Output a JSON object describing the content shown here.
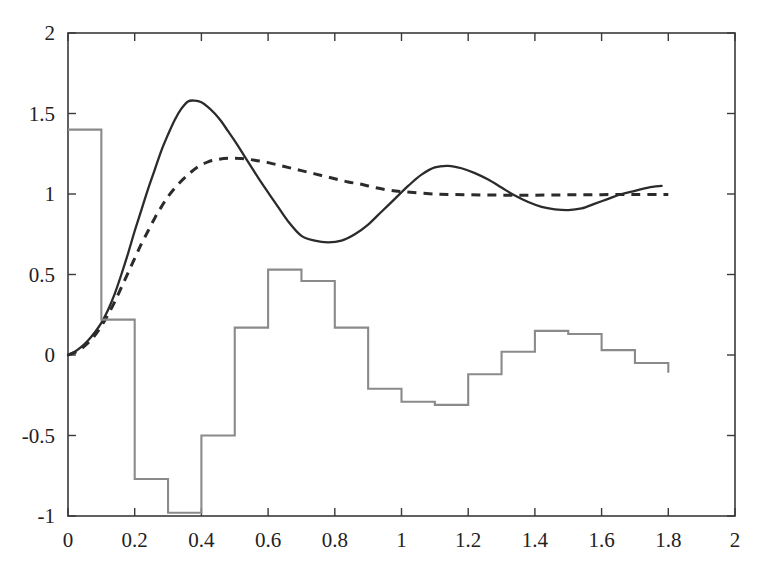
{
  "chart_data": {
    "type": "line",
    "title": "",
    "subtitle": "",
    "xlabel": "",
    "ylabel": "",
    "xlim": [
      0,
      2
    ],
    "ylim": [
      -1,
      2
    ],
    "grid": false,
    "legend": "none",
    "background_color": "#ffffff",
    "xticks": [
      0,
      0.2,
      0.4,
      0.6,
      0.8,
      1,
      1.2,
      1.4,
      1.6,
      1.8,
      2
    ],
    "xtick_labels": [
      "0",
      "0.2",
      "0.4",
      "0.6",
      "0.8",
      "1",
      "1.2",
      "1.4",
      "1.6",
      "1.8",
      "2"
    ],
    "yticks": [
      -1,
      -0.5,
      0,
      0.5,
      1,
      1.5,
      2
    ],
    "ytick_labels": [
      "-1",
      "-0.5",
      "0",
      "0.5",
      "1",
      "1.5",
      "2"
    ],
    "series": [
      {
        "name": "solid-response",
        "style": "solid",
        "color": "#2b2b2b",
        "linewidth": 2.3,
        "x": [
          0,
          0.02,
          0.04,
          0.06,
          0.08,
          0.1,
          0.12,
          0.14,
          0.16,
          0.18,
          0.2,
          0.22,
          0.24,
          0.26,
          0.28,
          0.3,
          0.32,
          0.34,
          0.36,
          0.38,
          0.4,
          0.42,
          0.44,
          0.46,
          0.48,
          0.5,
          0.54,
          0.58,
          0.62,
          0.66,
          0.7,
          0.74,
          0.78,
          0.82,
          0.86,
          0.9,
          0.94,
          0.98,
          1.02,
          1.06,
          1.1,
          1.14,
          1.18,
          1.22,
          1.26,
          1.3,
          1.34,
          1.38,
          1.42,
          1.46,
          1.5,
          1.54,
          1.58,
          1.62,
          1.66,
          1.7,
          1.74,
          1.78
        ],
        "y": [
          0.0,
          0.02,
          0.05,
          0.09,
          0.14,
          0.2,
          0.28,
          0.38,
          0.5,
          0.63,
          0.77,
          0.9,
          1.03,
          1.15,
          1.27,
          1.37,
          1.46,
          1.53,
          1.575,
          1.58,
          1.57,
          1.54,
          1.5,
          1.45,
          1.39,
          1.33,
          1.2,
          1.07,
          0.95,
          0.83,
          0.74,
          0.71,
          0.7,
          0.71,
          0.75,
          0.81,
          0.89,
          0.97,
          1.05,
          1.12,
          1.165,
          1.175,
          1.16,
          1.13,
          1.09,
          1.04,
          0.99,
          0.95,
          0.92,
          0.905,
          0.9,
          0.91,
          0.94,
          0.97,
          1.0,
          1.02,
          1.04,
          1.05
        ]
      },
      {
        "name": "dashed-response",
        "style": "dashed",
        "color": "#2b2b2b",
        "linewidth": 3.0,
        "dasharray": "9 7",
        "x": [
          0,
          0.02,
          0.04,
          0.06,
          0.08,
          0.1,
          0.12,
          0.14,
          0.16,
          0.18,
          0.2,
          0.22,
          0.24,
          0.26,
          0.28,
          0.3,
          0.33,
          0.36,
          0.39,
          0.42,
          0.45,
          0.48,
          0.52,
          0.56,
          0.6,
          0.64,
          0.68,
          0.72,
          0.76,
          0.8,
          0.84,
          0.88,
          0.92,
          0.96,
          1.0,
          1.1,
          1.2,
          1.3,
          1.4,
          1.5,
          1.6,
          1.7,
          1.8
        ],
        "y": [
          0.0,
          0.015,
          0.04,
          0.075,
          0.12,
          0.18,
          0.25,
          0.33,
          0.42,
          0.51,
          0.6,
          0.69,
          0.77,
          0.85,
          0.92,
          0.985,
          1.06,
          1.12,
          1.17,
          1.2,
          1.215,
          1.222,
          1.22,
          1.21,
          1.195,
          1.175,
          1.155,
          1.135,
          1.115,
          1.095,
          1.075,
          1.06,
          1.04,
          1.025,
          1.015,
          1.0,
          0.995,
          0.993,
          0.993,
          0.995,
          0.996,
          0.997,
          0.997
        ]
      },
      {
        "name": "step-control",
        "style": "step",
        "color": "#8a8a8a",
        "linewidth": 2.1,
        "step_edges": [
          0,
          0.1,
          0.2,
          0.3,
          0.4,
          0.5,
          0.6,
          0.7,
          0.8,
          0.9,
          1.0,
          1.1,
          1.2,
          1.3,
          1.4,
          1.5,
          1.6,
          1.7,
          1.8
        ],
        "step_values": [
          1.4,
          0.22,
          -0.77,
          -0.98,
          -0.5,
          0.17,
          0.53,
          0.46,
          0.17,
          -0.21,
          -0.29,
          -0.31,
          -0.12,
          0.02,
          0.15,
          0.13,
          0.03,
          -0.05,
          -0.11
        ]
      }
    ],
    "annotations": []
  },
  "axes": {
    "frame_color": "#3a3a3a",
    "tick_color": "#3a3a3a"
  }
}
